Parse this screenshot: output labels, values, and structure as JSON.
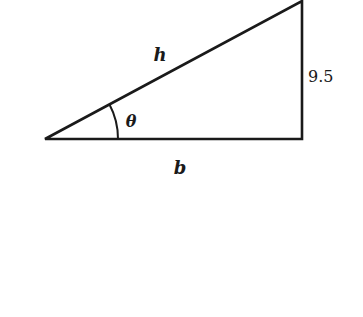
{
  "diagram": {
    "type": "right-triangle",
    "labels": {
      "hypotenuse": "h",
      "base": "b",
      "opposite": "9.5",
      "angle": "θ"
    },
    "colors": {
      "stroke": "#1a1a1a",
      "background": "#ffffff"
    }
  }
}
